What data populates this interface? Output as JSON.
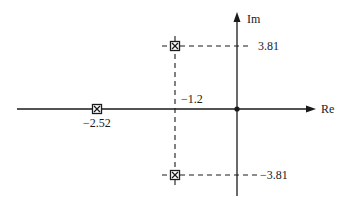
{
  "diagram": {
    "type": "s-plane pole plot",
    "axes": {
      "real_label": "Re",
      "imag_label": "Im"
    },
    "poles": [
      {
        "re": -2.52,
        "im": 0,
        "label": "−2.52"
      },
      {
        "re": -1.2,
        "im": 3.81,
        "label": "3.81"
      },
      {
        "re": -1.2,
        "im": -3.81,
        "label": "−3.81"
      }
    ],
    "labels": {
      "real_part_complex": "−1.2",
      "imag_pos": "3.81",
      "imag_neg": "−3.81",
      "real_pole": "−2.52"
    },
    "origin_marker": "dot",
    "pole_marker": "boxed-x",
    "colors": {
      "line": "#1a1a1a",
      "background": "#ffffff"
    }
  }
}
